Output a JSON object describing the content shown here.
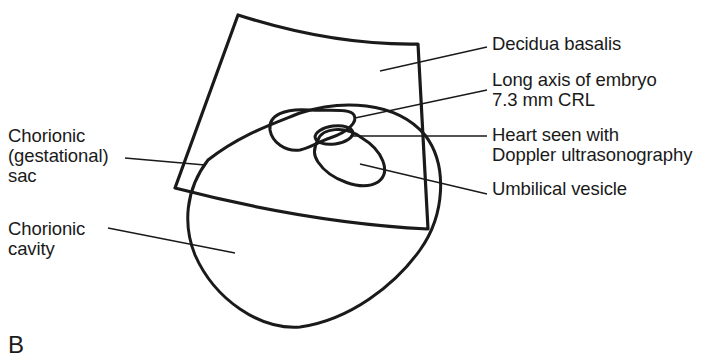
{
  "figure": {
    "panel_label": "B",
    "colors": {
      "ink": "#1a1a1a",
      "background": "#ffffff"
    }
  },
  "labels": {
    "decidua_basalis": "Decidua basalis",
    "long_axis_line1": "Long axis of embryo",
    "long_axis_line2": "7.3 mm CRL",
    "heart_line1": "Heart seen with",
    "heart_line2": "Doppler ultrasonography",
    "umbilical_vesicle": "Umbilical vesicle",
    "chorionic_sac_line1": "Chorionic",
    "chorionic_sac_line2": "(gestational)",
    "chorionic_sac_line3": "sac",
    "chorionic_cavity_line1": "Chorionic",
    "chorionic_cavity_line2": "cavity"
  }
}
